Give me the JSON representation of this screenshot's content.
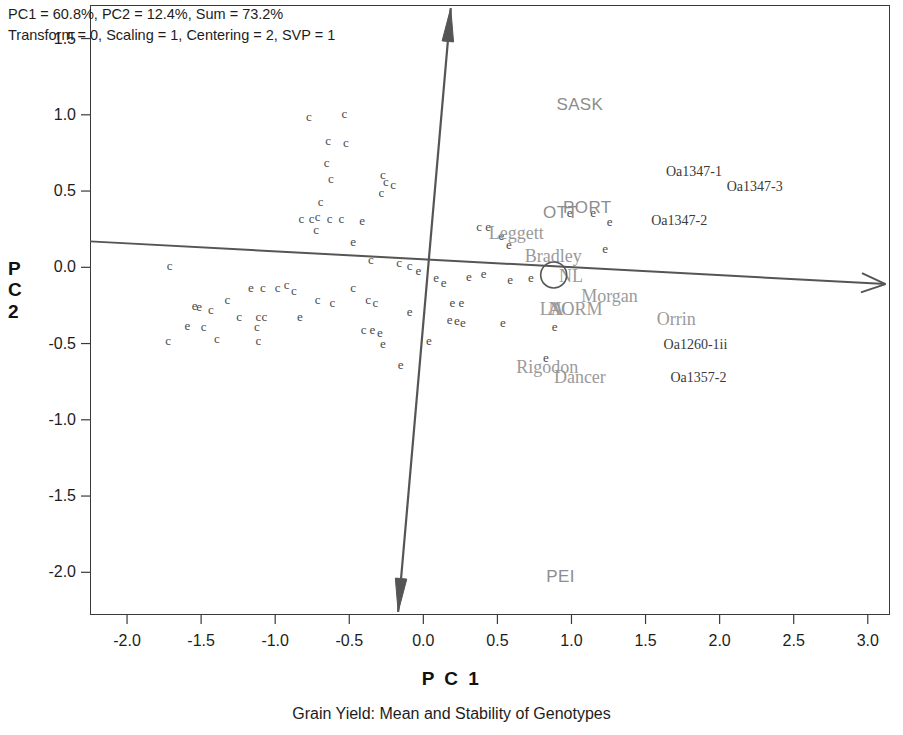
{
  "header": {
    "line1": "PC1 = 60.8%, PC2 = 12.4%, Sum = 73.2%",
    "line2": "Transform = 0, Scaling = 1, Centering = 2, SVP = 1"
  },
  "axis_titles": {
    "x": "P C 1",
    "y_chars": [
      "P",
      "C",
      "2"
    ]
  },
  "caption": "Grain Yield: Mean and Stability of Genotypes",
  "chart_data": {
    "type": "scatter",
    "title": "Grain Yield: Mean and Stability of Genotypes",
    "subtitle": "PC1 = 60.8%, PC2 = 12.4%, Sum = 73.2%",
    "annotation": "Transform = 0, Scaling = 1, Centering = 2, SVP = 1",
    "xlabel": "P C 1",
    "ylabel": "P C 2",
    "xlim": [
      -2.25,
      3.15
    ],
    "ylim": [
      -2.28,
      1.72
    ],
    "xticks": [
      -2.0,
      -1.5,
      -1.0,
      -0.5,
      0.0,
      0.5,
      1.0,
      1.5,
      2.0,
      2.5,
      3.0
    ],
    "xtick_labels": [
      "-2.0",
      "-1.5",
      "-1.0",
      "-0.5",
      "0.0",
      "0.5",
      "1.0",
      "1.5",
      "2.0",
      "2.5",
      "3.0"
    ],
    "yticks": [
      1.5,
      1.0,
      0.5,
      0.0,
      -0.5,
      -1.0,
      -1.5,
      -2.0
    ],
    "ytick_labels": [
      "1.5",
      "1.0",
      "0.5",
      "0.0",
      "-0.5",
      "-1.0",
      "-1.5",
      "-2.0"
    ],
    "grid": false,
    "legend": "none",
    "pc1_percent": 60.8,
    "pc2_percent": 12.4,
    "sum_percent": 73.2,
    "transform": 0,
    "scaling": 1,
    "centering": 2,
    "svp": 1,
    "environment_labels": [
      {
        "name": "SASK",
        "x": 1.05,
        "y": 1.08
      },
      {
        "name": "OTT",
        "x": 0.92,
        "y": 0.37
      },
      {
        "name": "PORT",
        "x": 1.1,
        "y": 0.4
      },
      {
        "name": "PEI",
        "x": 0.92,
        "y": -2.02
      }
    ],
    "genotype_labels": [
      {
        "name": "Leggett",
        "x": 0.62,
        "y": 0.23
      },
      {
        "name": "Bradley",
        "x": 0.87,
        "y": 0.08
      },
      {
        "name": "NL",
        "x": 0.99,
        "y": -0.05
      },
      {
        "name": "Morgan",
        "x": 1.25,
        "y": -0.18
      },
      {
        "name": "LA",
        "x": 0.86,
        "y": -0.27
      },
      {
        "name": "AC",
        "x": 0.92,
        "y": -0.27
      },
      {
        "name": "NORM",
        "x": 1.02,
        "y": -0.27
      },
      {
        "name": "Orrin",
        "x": 1.7,
        "y": -0.33
      },
      {
        "name": "Rigodon",
        "x": 0.83,
        "y": -0.65
      },
      {
        "name": "Dancer",
        "x": 1.05,
        "y": -0.71
      }
    ],
    "entry_codes": [
      {
        "name": "Oa1347-1",
        "x": 1.82,
        "y": 0.63
      },
      {
        "name": "Oa1347-3",
        "x": 2.23,
        "y": 0.53
      },
      {
        "name": "Oa1347-2",
        "x": 1.72,
        "y": 0.31
      },
      {
        "name": "Oa1260-1ii",
        "x": 1.83,
        "y": -0.5
      },
      {
        "name": "Oa1357-2",
        "x": 1.85,
        "y": -0.72
      }
    ],
    "marker_circle": {
      "x": 0.88,
      "y": -0.05,
      "radius_px": 13
    },
    "aec_abscissa": {
      "from": {
        "x": -2.25,
        "y": 0.17
      },
      "to": {
        "x": 3.12,
        "y": -0.11
      },
      "arrow_at": "to"
    },
    "aec_ordinate": {
      "from": {
        "x": -0.17,
        "y": -2.26
      },
      "to": {
        "x": 0.185,
        "y": 1.7
      },
      "arrow_at": "both"
    },
    "points": [
      {
        "g": "c",
        "x": -0.78,
        "y": 1.0
      },
      {
        "g": "c",
        "x": -0.54,
        "y": 1.02
      },
      {
        "g": "c",
        "x": -0.65,
        "y": 0.84
      },
      {
        "g": "c",
        "x": -0.53,
        "y": 0.83
      },
      {
        "g": "c",
        "x": -0.66,
        "y": 0.7
      },
      {
        "g": "c",
        "x": -0.63,
        "y": 0.59
      },
      {
        "g": "c",
        "x": -0.28,
        "y": 0.62
      },
      {
        "g": "c",
        "x": -0.26,
        "y": 0.57
      },
      {
        "g": "c",
        "x": -0.21,
        "y": 0.55
      },
      {
        "g": "c",
        "x": -0.29,
        "y": 0.5
      },
      {
        "g": "c",
        "x": -0.7,
        "y": 0.44
      },
      {
        "g": "c",
        "x": -0.83,
        "y": 0.33
      },
      {
        "g": "c",
        "x": -0.76,
        "y": 0.33
      },
      {
        "g": "c",
        "x": -0.72,
        "y": 0.34
      },
      {
        "g": "c",
        "x": -0.64,
        "y": 0.33
      },
      {
        "g": "c",
        "x": -0.56,
        "y": 0.33
      },
      {
        "g": "e",
        "x": -0.42,
        "y": 0.32
      },
      {
        "g": "c",
        "x": -0.73,
        "y": 0.26
      },
      {
        "g": "e",
        "x": -0.48,
        "y": 0.18
      },
      {
        "g": "c",
        "x": 0.37,
        "y": 0.28
      },
      {
        "g": "e",
        "x": 0.43,
        "y": 0.28
      },
      {
        "g": "e",
        "x": 0.52,
        "y": 0.22
      },
      {
        "g": "e",
        "x": 0.57,
        "y": 0.16
      },
      {
        "g": "e",
        "x": 0.98,
        "y": 0.37
      },
      {
        "g": "e",
        "x": 1.14,
        "y": 0.37
      },
      {
        "g": "e",
        "x": 1.25,
        "y": 0.31
      },
      {
        "g": "e",
        "x": 1.22,
        "y": 0.13
      },
      {
        "g": "c",
        "x": -0.36,
        "y": 0.06
      },
      {
        "g": "c",
        "x": -0.17,
        "y": 0.04
      },
      {
        "g": "c",
        "x": -0.1,
        "y": 0.02
      },
      {
        "g": "e",
        "x": -0.04,
        "y": -0.01
      },
      {
        "g": "c",
        "x": -1.72,
        "y": 0.02
      },
      {
        "g": "e",
        "x": 0.08,
        "y": -0.06
      },
      {
        "g": "e",
        "x": 0.13,
        "y": -0.09
      },
      {
        "g": "e",
        "x": 0.3,
        "y": -0.05
      },
      {
        "g": "e",
        "x": 0.4,
        "y": -0.03
      },
      {
        "g": "e",
        "x": 0.58,
        "y": -0.07
      },
      {
        "g": "e",
        "x": 0.72,
        "y": -0.06
      },
      {
        "g": "c",
        "x": -0.93,
        "y": -0.1
      },
      {
        "g": "e",
        "x": -1.17,
        "y": -0.12
      },
      {
        "g": "c",
        "x": -1.09,
        "y": -0.12
      },
      {
        "g": "c",
        "x": -0.99,
        "y": -0.12
      },
      {
        "g": "c",
        "x": -0.88,
        "y": -0.14
      },
      {
        "g": "c",
        "x": -0.48,
        "y": -0.12
      },
      {
        "g": "c",
        "x": -1.33,
        "y": -0.2
      },
      {
        "g": "c",
        "x": -0.72,
        "y": -0.2
      },
      {
        "g": "c",
        "x": -0.62,
        "y": -0.22
      },
      {
        "g": "c",
        "x": -0.38,
        "y": -0.2
      },
      {
        "g": "c",
        "x": -0.33,
        "y": -0.22
      },
      {
        "g": "e",
        "x": 0.19,
        "y": -0.22
      },
      {
        "g": "e",
        "x": 0.25,
        "y": -0.22
      },
      {
        "g": "e",
        "x": -1.55,
        "y": -0.24
      },
      {
        "g": "e",
        "x": -1.52,
        "y": -0.25
      },
      {
        "g": "c",
        "x": -1.44,
        "y": -0.27
      },
      {
        "g": "e",
        "x": -0.1,
        "y": -0.28
      },
      {
        "g": "c",
        "x": -1.25,
        "y": -0.31
      },
      {
        "g": "c",
        "x": -1.12,
        "y": -0.31
      },
      {
        "g": "c",
        "x": -1.08,
        "y": -0.31
      },
      {
        "g": "e",
        "x": -0.84,
        "y": -0.31
      },
      {
        "g": "e",
        "x": 0.17,
        "y": -0.33
      },
      {
        "g": "e",
        "x": 0.22,
        "y": -0.34
      },
      {
        "g": "e",
        "x": 0.26,
        "y": -0.35
      },
      {
        "g": "e",
        "x": -1.6,
        "y": -0.37
      },
      {
        "g": "c",
        "x": -1.49,
        "y": -0.38
      },
      {
        "g": "c",
        "x": -1.13,
        "y": -0.38
      },
      {
        "g": "c",
        "x": -0.41,
        "y": -0.4
      },
      {
        "g": "e",
        "x": -0.35,
        "y": -0.4
      },
      {
        "g": "e",
        "x": -0.3,
        "y": -0.42
      },
      {
        "g": "e",
        "x": 0.53,
        "y": -0.35
      },
      {
        "g": "e",
        "x": 0.88,
        "y": -0.38
      },
      {
        "g": "c",
        "x": -1.73,
        "y": -0.47
      },
      {
        "g": "c",
        "x": -1.4,
        "y": -0.46
      },
      {
        "g": "c",
        "x": -1.12,
        "y": -0.47
      },
      {
        "g": "e",
        "x": -0.28,
        "y": -0.49
      },
      {
        "g": "e",
        "x": 0.03,
        "y": -0.47
      },
      {
        "g": "e",
        "x": -0.16,
        "y": -0.63
      },
      {
        "g": "e",
        "x": 0.82,
        "y": -0.58
      }
    ]
  }
}
